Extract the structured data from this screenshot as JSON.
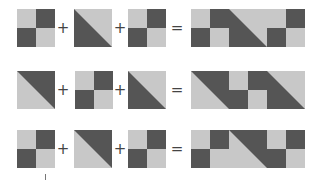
{
  "colors": {
    "light": "#c8c8c8",
    "dark": "#555555",
    "operator": "#444444"
  },
  "operators": {
    "plus": "+",
    "equals": "="
  },
  "tile_types": {
    "checker": "2x2 checkerboard: light top-left, dark top-right, dark bottom-left, light bottom-right",
    "diag_dark_bl": "diagonal split top-left to bottom-right: dark bottom-left triangle, light top-right triangle",
    "diag_dark_tr": "diagonal split top-left to bottom-right: dark top-right triangle, light bottom-left triangle"
  },
  "rows": [
    {
      "inputs": [
        "checker",
        "diag_dark_bl",
        "checker"
      ],
      "result": [
        "checker",
        "diag_dark_bl",
        "checker"
      ]
    },
    {
      "inputs": [
        "diag_dark_tr",
        "checker",
        "diag_dark_bl"
      ],
      "result": [
        "diag_dark_tr",
        "checker",
        "diag_dark_bl"
      ]
    },
    {
      "inputs": [
        "checker",
        "diag_dark_tr",
        "checker"
      ],
      "result": [
        "checker",
        "diag_dark_tr",
        "checker"
      ]
    }
  ]
}
